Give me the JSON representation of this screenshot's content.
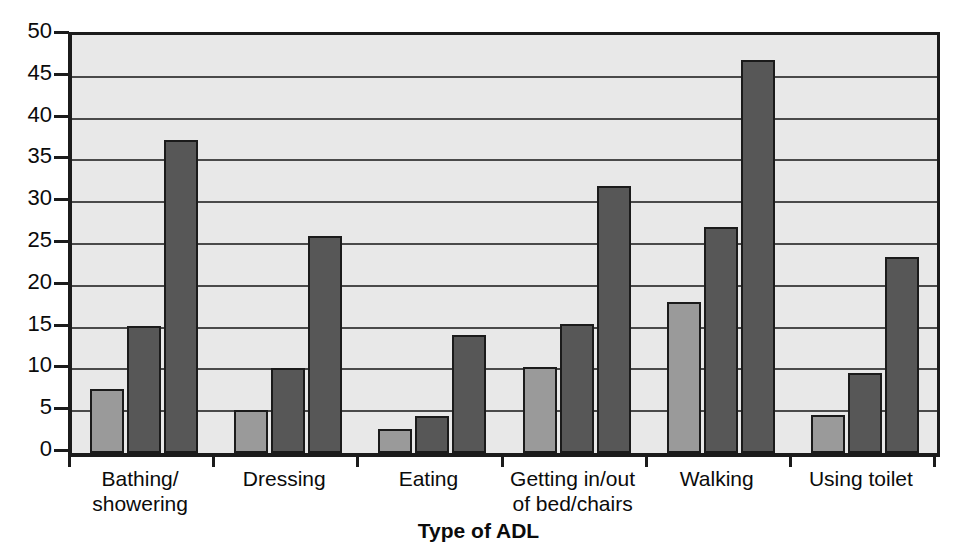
{
  "chart_data": {
    "type": "bar",
    "title": "",
    "subtitle": "",
    "xlabel": "Type of ADL",
    "ylabel": "",
    "ylim": [
      0,
      50
    ],
    "ytick_step": 5,
    "yticks": [
      0,
      5,
      10,
      15,
      20,
      25,
      30,
      35,
      40,
      45,
      50
    ],
    "ytick_labels": [
      "0",
      "5",
      "10",
      "15",
      "20",
      "25",
      "30",
      "35",
      "40",
      "45",
      "50"
    ],
    "grid": true,
    "grid_axis": "y",
    "legend": false,
    "legend_position": "none",
    "orientation": "vertical",
    "grouping": "grouped",
    "categories": [
      "Bathing/ showering",
      "Dressing",
      "Eating",
      "Getting in/out of bed/chairs",
      "Walking",
      "Using toilet"
    ],
    "category_lines": [
      [
        "Bathing/",
        "showering"
      ],
      [
        "Dressing"
      ],
      [
        "Eating"
      ],
      [
        "Getting in/out",
        "of bed/chairs"
      ],
      [
        "Walking"
      ],
      [
        "Using toilet"
      ]
    ],
    "series": [
      {
        "name": "Series 1",
        "color": "#9a9a9a",
        "values": [
          7.7,
          5.1,
          2.9,
          10.3,
          18.1,
          4.5
        ]
      },
      {
        "name": "Series 2",
        "color": "#575757",
        "values": [
          15.2,
          10.2,
          4.4,
          15.4,
          27.0,
          9.6
        ]
      },
      {
        "name": "Series 3",
        "color": "#575757",
        "values": [
          37.5,
          25.9,
          14.1,
          31.9,
          47.0,
          23.4
        ]
      }
    ],
    "colors": {
      "plot_background": "#e8e8e8",
      "page_background": "#ffffff",
      "axis": "#1b1b1b",
      "gridline": "#4a4a4a",
      "series_1": "#9a9a9a",
      "series_2": "#575757",
      "series_3": "#575757",
      "text": "#0b0b0b"
    }
  }
}
